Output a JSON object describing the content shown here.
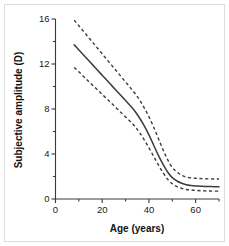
{
  "chart_data": {
    "type": "line",
    "title": "",
    "xlabel": "Age (years)",
    "ylabel": "Subjective amplitude (D)",
    "xlim": [
      0,
      70
    ],
    "ylim": [
      0,
      16
    ],
    "grid": false,
    "legend": "none",
    "x_ticks_major": [
      0,
      20,
      40,
      60
    ],
    "x_ticks_minor": [
      10,
      30,
      50,
      70
    ],
    "y_ticks_major": [
      0,
      4,
      8,
      12,
      16
    ],
    "y_ticks_minor": [
      2,
      6,
      10,
      14
    ],
    "x_tick_labels": [
      "0",
      "20",
      "40",
      "60"
    ],
    "y_tick_labels": [
      "0",
      "4",
      "8",
      "12",
      "16"
    ],
    "x": [
      8,
      10,
      12,
      14,
      16,
      18,
      20,
      22,
      24,
      26,
      28,
      30,
      32,
      34,
      36,
      38,
      40,
      42,
      44,
      46,
      48,
      50,
      52,
      54,
      56,
      58,
      60,
      62,
      64,
      66,
      68,
      70
    ],
    "series": [
      {
        "name": "Upper bound",
        "style": "dashed",
        "values": [
          15.9,
          15.4,
          14.9,
          14.4,
          13.9,
          13.4,
          12.9,
          12.4,
          11.9,
          11.4,
          10.9,
          10.4,
          9.9,
          9.4,
          8.8,
          8.1,
          7.3,
          6.4,
          5.4,
          4.4,
          3.5,
          2.8,
          2.4,
          2.1,
          1.95,
          1.88,
          1.84,
          1.82,
          1.8,
          1.79,
          1.78,
          1.78
        ]
      },
      {
        "name": "Mean subjective amplitude",
        "style": "solid",
        "values": [
          13.7,
          13.25,
          12.8,
          12.35,
          11.9,
          11.45,
          11.0,
          10.55,
          10.1,
          9.65,
          9.2,
          8.75,
          8.3,
          7.8,
          7.2,
          6.5,
          5.7,
          4.8,
          3.9,
          3.1,
          2.4,
          1.9,
          1.6,
          1.4,
          1.27,
          1.2,
          1.16,
          1.14,
          1.12,
          1.11,
          1.1,
          1.1
        ]
      },
      {
        "name": "Lower bound",
        "style": "dashed",
        "values": [
          11.7,
          11.3,
          10.9,
          10.5,
          10.1,
          9.7,
          9.3,
          8.9,
          8.5,
          8.1,
          7.7,
          7.3,
          6.9,
          6.45,
          5.9,
          5.25,
          4.55,
          3.8,
          3.05,
          2.35,
          1.75,
          1.35,
          1.1,
          0.95,
          0.85,
          0.8,
          0.76,
          0.74,
          0.72,
          0.71,
          0.7,
          0.7
        ]
      }
    ],
    "colors": {
      "axis": "#3a3a3a",
      "curve": "#3c3c3c",
      "background": "#ffffff",
      "border": "#dcdcdc"
    }
  }
}
